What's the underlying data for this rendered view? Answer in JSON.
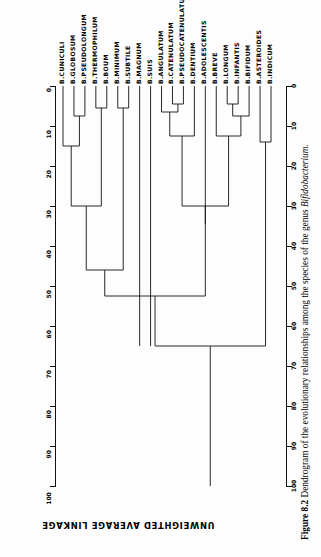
{
  "figure": {
    "caption_label": "Figure 8.2",
    "caption_text": "Dendrogram of the evolutionary relationships among the species of the genus",
    "caption_genus": "Bifidobacterium."
  },
  "axis": {
    "title": "UNWEIGHTED AVERAGE LINKAGE",
    "ticks": [
      "0",
      "10",
      "20",
      "30",
      "40",
      "50",
      "60",
      "70",
      "80",
      "90",
      "100"
    ],
    "min": 0,
    "max": 100,
    "step": 10
  },
  "chart_data": {
    "type": "dendrogram",
    "title": "Dendrogram of the evolutionary relationships among the species of the genus Bifidobacterium.",
    "xlabel": "",
    "ylabel": "UNWEIGHTED AVERAGE LINKAGE",
    "ylim": [
      0,
      100
    ],
    "y_ticks": [
      0,
      10,
      20,
      30,
      40,
      50,
      60,
      70,
      80,
      90,
      100
    ],
    "grid": false,
    "orientation": "vertical-down",
    "leaf_order": [
      "B.CUNICULI",
      "B.GLOBOSUM",
      "B.PSEUDOLONGUM",
      "B.THERMOPHILUM",
      "B.BOUM",
      "B.MINIMUM",
      "B.SUBTILE",
      "B.MAGNUM",
      "B.SUIS",
      "B.ANGULATUM",
      "B.CATENULATUM",
      "B.PSEUDOCATENULATUM",
      "B.DENTIUM",
      "B.ADOLESCENTIS",
      "B.BREVE",
      "B.LONGUM",
      "B.INFANTIS",
      "B.BIFIDUM",
      "B.ASTEROIDES",
      "B.INDICUM"
    ],
    "leaf_labels": [
      "B.CUNICULI",
      "B.GLOBOSUM",
      "B.PSEUDOLONGUM",
      "B.THERMOPHILUM",
      "B.BOUM",
      "B.MINIMUM",
      "B.SUBTILE",
      "B.MAGNUM",
      "B.SUIS",
      "B.ANGULATUM",
      "B.CATENULATUM",
      "B.PSEUDOCATENULATUM",
      "B.DENTIUM",
      "B.ADOLESCENTIS",
      "B.BREVE",
      "B.LONGUM",
      "B.INFANTIS",
      "B.BIFIDUM",
      "B.ASTEROIDES",
      "B.INDICUM"
    ],
    "merges": [
      {
        "id": "m1",
        "left": "B.GLOBOSUM",
        "right": "B.PSEUDOLONGUM",
        "height": 7.5
      },
      {
        "id": "m2",
        "left": "B.CUNICULI",
        "right": "m1",
        "height": 15.0
      },
      {
        "id": "m3",
        "left": "B.THERMOPHILUM",
        "right": "B.BOUM",
        "height": 5.5
      },
      {
        "id": "m4",
        "left": "B.MINIMUM",
        "right": "B.SUBTILE",
        "height": 5.5
      },
      {
        "id": "m5",
        "left": "m2",
        "right": "m3",
        "height": 30.0
      },
      {
        "id": "m6",
        "left": "m5",
        "right": "m4",
        "height": 46.0
      },
      {
        "id": "m7",
        "left": "B.CATENULATUM",
        "right": "B.PSEUDOCATENULATUM",
        "height": 4.5
      },
      {
        "id": "m8",
        "left": "B.ANGULATUM",
        "right": "m7",
        "height": 6.5
      },
      {
        "id": "m9",
        "left": "m8",
        "right": "B.DENTIUM",
        "height": 12.5
      },
      {
        "id": "m10",
        "left": "B.LONGUM",
        "right": "B.INFANTIS",
        "height": 4.5
      },
      {
        "id": "m11",
        "left": "m10",
        "right": "B.BIFIDUM",
        "height": 7.5
      },
      {
        "id": "m12",
        "left": "B.BREVE",
        "right": "m11",
        "height": 12.5
      },
      {
        "id": "m13",
        "left": "m9",
        "right": "m12",
        "height": 30.0
      },
      {
        "id": "m14",
        "left": "B.ADOLESCENTIS",
        "right": "m13",
        "height": 34.5
      },
      {
        "id": "m15",
        "left": "B.ASTEROIDES",
        "right": "B.INDICUM",
        "height": 14.0
      },
      {
        "id": "m16",
        "left": "m6",
        "right": "m14",
        "height": 52.5
      },
      {
        "id": "m17",
        "left": "m16",
        "right": "m15",
        "height": 65.0
      }
    ],
    "singleton_leaves_to_root": [
      "B.MAGNUM",
      "B.SUIS"
    ],
    "root_height": 65.0,
    "root_stem_to": 100.0
  }
}
